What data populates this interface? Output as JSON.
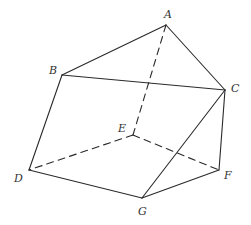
{
  "diagram": {
    "type": "polyhedron",
    "colors": {
      "stroke": "#2a2a2a",
      "label": "#333333",
      "background": "#ffffff"
    },
    "vertices": {
      "A": {
        "label": "A",
        "x": 166,
        "y": 25,
        "lx": 164,
        "ly": 18
      },
      "B": {
        "label": "B",
        "x": 62,
        "y": 75,
        "lx": 49,
        "ly": 74
      },
      "C": {
        "label": "C",
        "x": 225,
        "y": 90,
        "lx": 231,
        "ly": 92
      },
      "D": {
        "label": "D",
        "x": 29,
        "y": 170,
        "lx": 14,
        "ly": 182
      },
      "E": {
        "label": "E",
        "x": 133,
        "y": 135,
        "lx": 118,
        "ly": 132
      },
      "F": {
        "label": "F",
        "x": 219,
        "y": 170,
        "lx": 224,
        "ly": 179
      },
      "G": {
        "label": "G",
        "x": 142,
        "y": 198,
        "lx": 138,
        "ly": 215
      }
    },
    "edges_visible": [
      [
        "A",
        "B"
      ],
      [
        "A",
        "C"
      ],
      [
        "B",
        "C"
      ],
      [
        "B",
        "D"
      ],
      [
        "C",
        "F"
      ],
      [
        "C",
        "G"
      ],
      [
        "D",
        "G"
      ],
      [
        "G",
        "F"
      ]
    ],
    "edges_hidden": [
      [
        "A",
        "E"
      ],
      [
        "E",
        "D"
      ],
      [
        "E",
        "F"
      ]
    ]
  }
}
